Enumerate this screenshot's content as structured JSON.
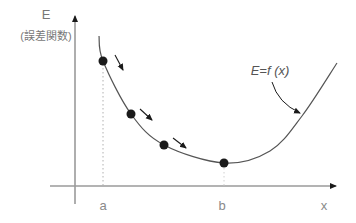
{
  "diagram": {
    "type": "annotated-curve",
    "topic": "gradient descent on an error function",
    "y_axis": {
      "label": "E",
      "sublabel": "(誤差関数)",
      "x": 75,
      "y_top": 16,
      "y_bottom": 204
    },
    "x_axis": {
      "label": "x",
      "y": 186,
      "x_left": 50,
      "x_right": 336,
      "ticks": [
        "a",
        "b"
      ]
    },
    "curve": {
      "label": "E=f (x)",
      "points": [
        [
          99,
          36
        ],
        [
          103,
          61
        ],
        [
          131,
          114
        ],
        [
          164,
          145
        ],
        [
          224,
          163
        ],
        [
          270,
          151
        ],
        [
          302,
          116
        ],
        [
          337,
          63
        ]
      ]
    },
    "descent_points": [
      [
        103,
        61
      ],
      [
        131,
        114
      ],
      [
        164,
        145
      ],
      [
        224,
        163
      ]
    ],
    "step_arrows": [
      {
        "from": [
          115,
          55
        ],
        "to": [
          123,
          70
        ]
      },
      {
        "from": [
          140,
          109
        ],
        "to": [
          152,
          120
        ]
      },
      {
        "from": [
          173,
          138
        ],
        "to": [
          186,
          148
        ]
      }
    ],
    "label_arrow": {
      "from": [
        272,
        82
      ],
      "ctrl": [
        278,
        103
      ],
      "to": [
        300,
        113
      ]
    },
    "guides": [
      {
        "x": 103,
        "y1": 64,
        "y2": 186,
        "tick": "a",
        "color": "#b0b0b0"
      },
      {
        "x": 224,
        "y1": 168,
        "y2": 186,
        "tick": "b",
        "color": "#d0d0d0"
      }
    ],
    "colors": {
      "axis": "#9a9a9a",
      "curve": "#555555",
      "dot": "#1a1a1a",
      "arrow": "#1a1a1a",
      "text": "#777777",
      "background": "#ffffff"
    }
  }
}
